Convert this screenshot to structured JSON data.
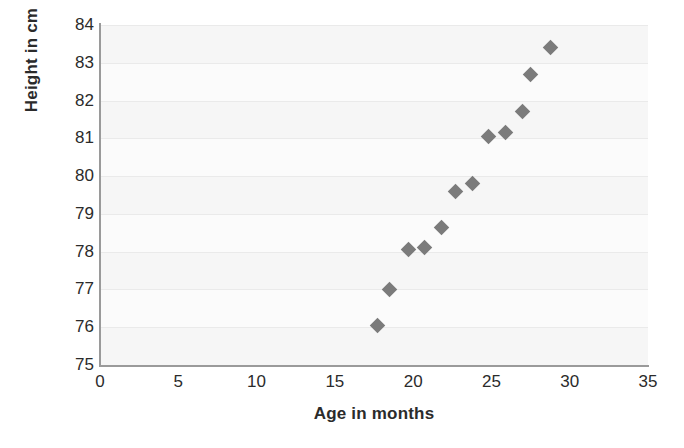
{
  "chart_data": {
    "type": "scatter",
    "title": "",
    "xlabel": "Age in months",
    "ylabel": "Height in cm",
    "xlim": [
      0,
      35
    ],
    "ylim": [
      75,
      84
    ],
    "xticks": [
      0,
      5,
      10,
      15,
      20,
      25,
      30,
      35
    ],
    "yticks": [
      75,
      76,
      77,
      78,
      79,
      80,
      81,
      82,
      83,
      84
    ],
    "xtick_labels": [
      "0",
      "5",
      "10",
      "15",
      "20",
      "25",
      "30",
      "35"
    ],
    "ytick_labels": [
      "75",
      "76",
      "77",
      "78",
      "79",
      "80",
      "81",
      "82",
      "83",
      "84"
    ],
    "grid": true,
    "grid_axis": "y",
    "legend": false,
    "legend_position": "none",
    "marker": "diamond",
    "marker_color": "#7b7b7b",
    "plot_background": "#fbfbfb",
    "series": [
      {
        "name": "Height vs Age",
        "points": [
          {
            "x": 17.7,
            "y": 76.05
          },
          {
            "x": 18.5,
            "y": 77.0
          },
          {
            "x": 19.7,
            "y": 78.05
          },
          {
            "x": 20.7,
            "y": 78.1
          },
          {
            "x": 21.8,
            "y": 78.65
          },
          {
            "x": 22.7,
            "y": 79.6
          },
          {
            "x": 23.8,
            "y": 79.8
          },
          {
            "x": 24.8,
            "y": 81.05
          },
          {
            "x": 25.9,
            "y": 81.15
          },
          {
            "x": 27.0,
            "y": 81.7
          },
          {
            "x": 27.5,
            "y": 82.7
          },
          {
            "x": 28.8,
            "y": 83.4
          }
        ]
      }
    ]
  }
}
